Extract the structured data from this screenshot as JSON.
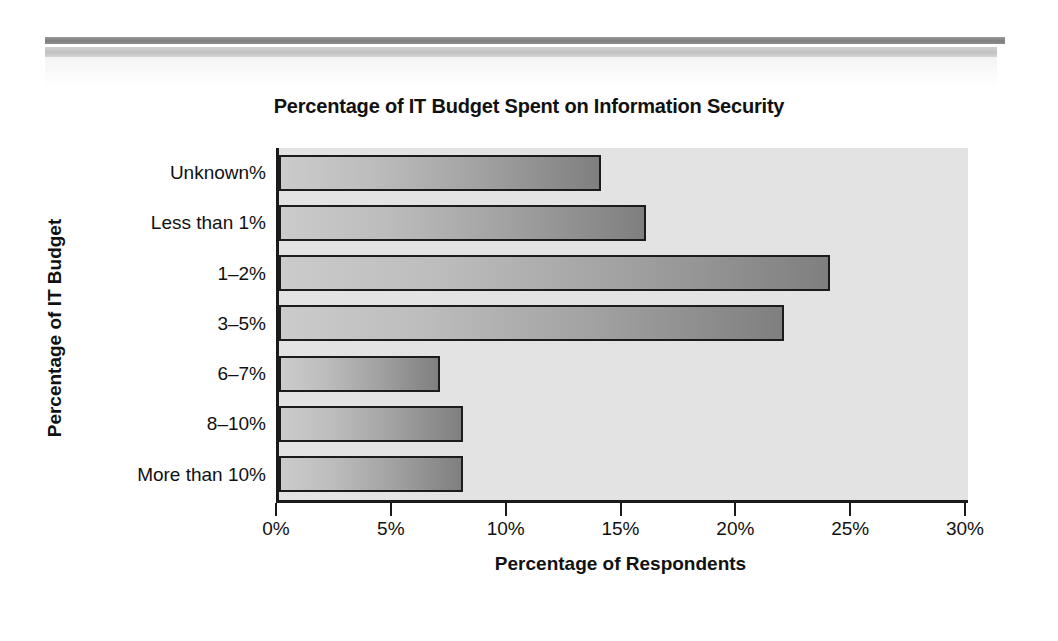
{
  "decor": {
    "rule_dark_color": "#7e7e7e",
    "rule_light_color": "#c2c2c2"
  },
  "chart_data": {
    "type": "bar",
    "orientation": "horizontal",
    "title": "Percentage of IT Budget Spent on Information Security",
    "xlabel": "Percentage of Respondents",
    "ylabel": "Percentage of IT Budget",
    "categories": [
      "Unknown%",
      "Less than 1%",
      "1–2%",
      "3–5%",
      "6–7%",
      "8–10%",
      "More than 10%"
    ],
    "values": [
      14,
      16,
      24,
      22,
      7,
      8,
      8
    ],
    "xlim": [
      0,
      30
    ],
    "xticks": [
      0,
      5,
      10,
      15,
      20,
      25,
      30
    ],
    "xtick_labels": [
      "0%",
      "5%",
      "10%",
      "15%",
      "20%",
      "25%",
      "30%"
    ],
    "grid": false,
    "legend": null,
    "plot_background": "#e3e3e3",
    "bar_fill_start": "#cbcbcb",
    "bar_fill_end": "#7f7f7f",
    "bar_border": "#1c1c1c",
    "axis_color": "#1a1a1a"
  }
}
